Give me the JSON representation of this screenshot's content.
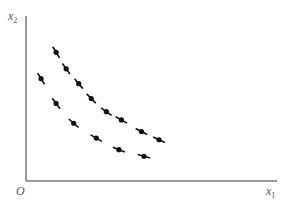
{
  "chart_data": {
    "type": "line",
    "title": "",
    "xlabel": "x1",
    "ylabel": "x2",
    "origin_label": "O",
    "grid": false,
    "legend": null,
    "line_style": "dashed with dot markers",
    "xlim": [
      0,
      100
    ],
    "ylim": [
      0,
      100
    ],
    "series": [
      {
        "name": "upper indifference curve",
        "x": [
          12,
          16,
          21,
          26,
          32,
          38,
          46,
          53
        ],
        "y": [
          78,
          68,
          59,
          50,
          42,
          37,
          30,
          25
        ]
      },
      {
        "name": "lower indifference curve",
        "x": [
          6,
          12,
          19,
          28,
          37,
          47
        ],
        "y": [
          62,
          47,
          35,
          26,
          19,
          15
        ]
      }
    ]
  },
  "labels": {
    "y_axis_main": "x",
    "y_axis_sub": "2",
    "x_axis_main": "x",
    "x_axis_sub": "1",
    "origin": "O"
  },
  "colors": {
    "axis": "#777777",
    "curve": "#111111",
    "label": "#555555"
  }
}
